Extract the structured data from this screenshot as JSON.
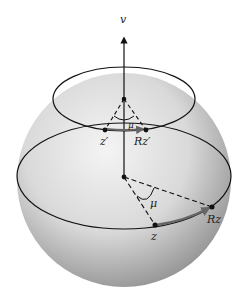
{
  "diagram": {
    "type": "sphere-rotation-diagram",
    "labels": {
      "axis": "v",
      "point_z": "z",
      "point_Rz": "Rz",
      "point_z_prime": "z′",
      "point_Rz_prime": "Rz′",
      "angle_large": "μ",
      "angle_small": "μ"
    },
    "colors": {
      "sphere_light": "#f2f2f2",
      "sphere_dark": "#8a8a8a",
      "line": "#111111",
      "arc_highlight": "#666666"
    }
  }
}
